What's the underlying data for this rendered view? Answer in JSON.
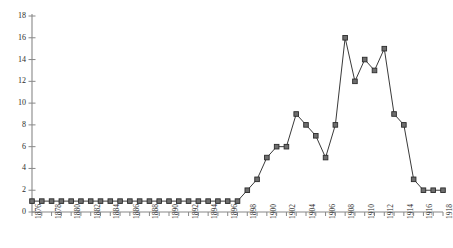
{
  "chart_data": {
    "type": "line",
    "title": "",
    "subtitle": "",
    "xlabel": "",
    "ylabel": "",
    "grid": false,
    "legend": false,
    "marker": "square",
    "line_color": "#3a3a3a",
    "marker_color": "#555555",
    "axis_color": "#888888",
    "xlim": [
      1876,
      1918
    ],
    "ylim": [
      0,
      18
    ],
    "ytick_step": 2,
    "xtick_step": 1,
    "xtick_label_step": 2,
    "yticks": [
      0,
      2,
      4,
      6,
      8,
      10,
      12,
      14,
      16,
      18
    ],
    "ytick_labels": [
      "0",
      "2",
      "4",
      "6",
      "8",
      "10",
      "12",
      "14",
      "16",
      "18"
    ],
    "xticks": [
      1876,
      1877,
      1878,
      1879,
      1880,
      1881,
      1882,
      1883,
      1884,
      1885,
      1886,
      1887,
      1888,
      1889,
      1890,
      1891,
      1892,
      1893,
      1894,
      1895,
      1896,
      1897,
      1898,
      1899,
      1900,
      1901,
      1902,
      1903,
      1904,
      1905,
      1906,
      1907,
      1908,
      1909,
      1910,
      1911,
      1912,
      1913,
      1914,
      1915,
      1916,
      1917,
      1918
    ],
    "xtick_labels": [
      "1876",
      "1878",
      "1880",
      "1882",
      "1884",
      "1886",
      "1888",
      "1890",
      "1892",
      "1894",
      "1896",
      "1898",
      "1900",
      "1902",
      "1904",
      "1906",
      "1908",
      "1910",
      "1912",
      "1914",
      "1916",
      "1918"
    ],
    "x": [
      1876,
      1877,
      1878,
      1879,
      1880,
      1881,
      1882,
      1883,
      1884,
      1885,
      1886,
      1887,
      1888,
      1889,
      1890,
      1891,
      1892,
      1893,
      1894,
      1895,
      1896,
      1897,
      1898,
      1899,
      1900,
      1901,
      1902,
      1903,
      1904,
      1905,
      1906,
      1907,
      1908,
      1909,
      1910,
      1911,
      1912,
      1913,
      1914,
      1915,
      1916,
      1917,
      1918
    ],
    "values": [
      1,
      1,
      1,
      1,
      1,
      1,
      1,
      1,
      1,
      1,
      1,
      1,
      1,
      1,
      1,
      1,
      1,
      1,
      1,
      1,
      1,
      1,
      2,
      3,
      5,
      6,
      6,
      9,
      8,
      7,
      5,
      8,
      16,
      12,
      14,
      13,
      15,
      9,
      8,
      3,
      2,
      2,
      2
    ],
    "series": [
      {
        "name": "",
        "values": [
          1,
          1,
          1,
          1,
          1,
          1,
          1,
          1,
          1,
          1,
          1,
          1,
          1,
          1,
          1,
          1,
          1,
          1,
          1,
          1,
          1,
          1,
          2,
          3,
          5,
          6,
          6,
          9,
          8,
          7,
          5,
          8,
          16,
          12,
          14,
          13,
          15,
          9,
          8,
          3,
          2,
          2,
          2
        ]
      }
    ]
  }
}
